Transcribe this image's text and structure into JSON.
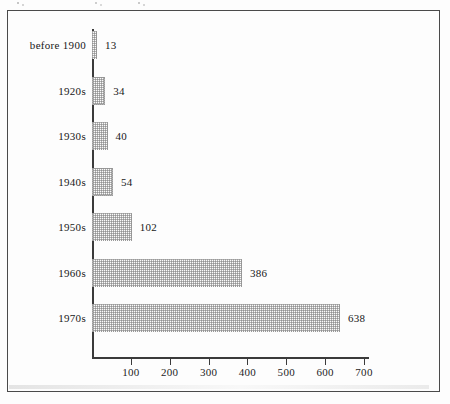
{
  "chart_data": {
    "type": "bar",
    "orientation": "horizontal",
    "title": "",
    "subtitle": "",
    "xlabel": "",
    "ylabel": "",
    "categories": [
      "before 1900",
      "1920s",
      "1930s",
      "1940s",
      "1950s",
      "1960s",
      "1970s"
    ],
    "values": [
      13,
      34,
      40,
      54,
      102,
      386,
      638
    ],
    "value_labels": [
      "13",
      "34",
      "40",
      "54",
      "102",
      "386",
      "638"
    ],
    "xlim": [
      0,
      700
    ],
    "xticks": [
      100,
      200,
      300,
      400,
      500,
      600,
      700
    ],
    "xtick_labels": [
      "100",
      "200",
      "300",
      "400",
      "500",
      "600",
      "700"
    ],
    "grid": false,
    "legend": false,
    "bar_fill": "halftone-checker-gray",
    "colors": {
      "axis": "#3b3b3b",
      "frame": "#4a4a4a",
      "text": "#181818",
      "bar_fill": "#fbfbfb",
      "bar_pattern": "#787878",
      "bar_border": "#9a9a9a",
      "background": "#fdfdfd"
    }
  }
}
